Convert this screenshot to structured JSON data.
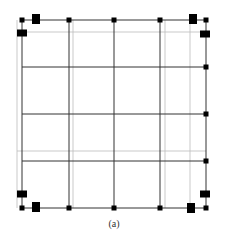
{
  "caption": "(a)",
  "colors": {
    "dark_line": "#333333",
    "light_line": "#bbbbbb",
    "node": "#000000",
    "background": "#ffffff"
  },
  "grid": {
    "dark_vertical_x": [
      22,
      69,
      114,
      160,
      206
    ],
    "dark_horizontal_y": [
      20,
      67,
      114,
      161,
      208
    ],
    "light_vertical_x": [
      17,
      73,
      165,
      190
    ],
    "light_horizontal_y": [
      32,
      151
    ],
    "bounds": {
      "left": 22,
      "right": 206,
      "top": 20,
      "bottom": 208
    }
  },
  "small_nodes": [
    [
      22,
      20
    ],
    [
      69,
      20
    ],
    [
      114,
      20
    ],
    [
      160,
      20
    ],
    [
      206,
      20
    ],
    [
      206,
      67
    ],
    [
      206,
      114
    ],
    [
      206,
      161
    ],
    [
      22,
      208
    ],
    [
      69,
      208
    ],
    [
      114,
      208
    ],
    [
      160,
      208
    ],
    [
      206,
      208
    ]
  ],
  "large_nodes": [
    [
      36,
      19,
      8,
      10
    ],
    [
      22,
      33,
      10,
      7
    ],
    [
      193,
      19,
      8,
      10
    ],
    [
      205,
      34,
      10,
      7
    ],
    [
      22,
      194,
      10,
      7
    ],
    [
      36,
      207,
      8,
      10
    ],
    [
      205,
      194,
      10,
      7
    ],
    [
      191,
      208,
      8,
      10
    ]
  ]
}
